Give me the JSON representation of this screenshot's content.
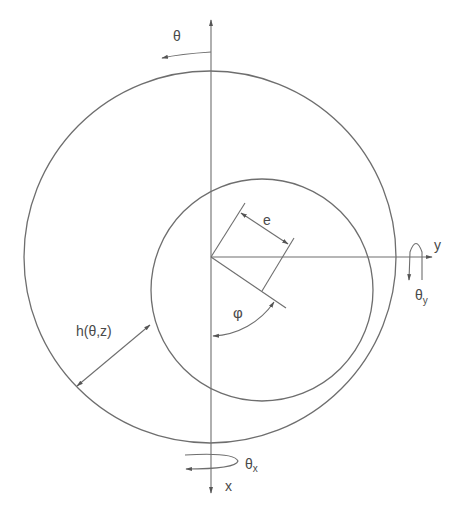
{
  "diagram": {
    "colors": {
      "stroke": "#6e6e6e",
      "text": "#4a4a4a",
      "background": "#ffffff"
    },
    "labels": {
      "theta": "θ",
      "y_axis": "y",
      "theta_y_main": "θ",
      "theta_y_sub": "y",
      "eccentricity": "e",
      "film_thickness": "h(θ,z)",
      "attitude_angle": "φ",
      "theta_x_main": "θ",
      "theta_x_sub": "x",
      "x_axis": "x"
    },
    "geometry": {
      "origin": [
        211,
        257
      ],
      "outer_circle": {
        "cx": 210,
        "cy": 257,
        "r": 186
      },
      "inner_circle": {
        "cx": 262,
        "cy": 290,
        "r": 111
      }
    }
  }
}
